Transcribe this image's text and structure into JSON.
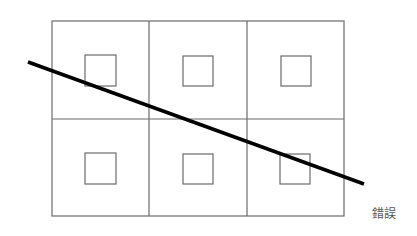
{
  "diagram": {
    "caption": "錯誤",
    "grid": {
      "rows": 2,
      "cols": 3,
      "left": 52,
      "top": 21,
      "right": 344,
      "bottom": 216,
      "col_dividers": [
        149,
        247
      ],
      "row_divider": 119,
      "stroke_color": "#6b6b6b"
    },
    "inner_squares": [
      {
        "x": 85,
        "y": 55,
        "size": 31
      },
      {
        "x": 183,
        "y": 56,
        "size": 30
      },
      {
        "x": 281,
        "y": 56,
        "size": 30
      },
      {
        "x": 85,
        "y": 153,
        "size": 31
      },
      {
        "x": 183,
        "y": 154,
        "size": 30
      },
      {
        "x": 280,
        "y": 154,
        "size": 30
      }
    ],
    "diagonal_line": {
      "x1": 28,
      "y1": 62,
      "x2": 364,
      "y2": 184,
      "color": "#000000",
      "width": 3.5
    }
  }
}
